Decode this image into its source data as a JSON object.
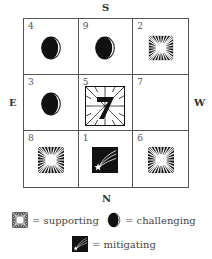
{
  "directions": {
    "top": "S",
    "bottom": "N",
    "left": "E",
    "right": "W"
  },
  "cells": [
    {
      "number": "4",
      "symbol": "challenging"
    },
    {
      "number": "9",
      "symbol": "challenging"
    },
    {
      "number": "2",
      "symbol": "supporting"
    },
    {
      "number": "3",
      "symbol": "challenging"
    },
    {
      "number": "5",
      "symbol": "supporting-seven"
    },
    {
      "number": "7",
      "symbol": "none"
    },
    {
      "number": "8",
      "symbol": "supporting"
    },
    {
      "number": "1",
      "symbol": "mitigating"
    },
    {
      "number": "6",
      "symbol": "supporting"
    }
  ],
  "legend": {
    "supporting": "= supporting",
    "challenging": "= challenging",
    "mitigating": "= mitigating"
  },
  "center_glyph": "7"
}
